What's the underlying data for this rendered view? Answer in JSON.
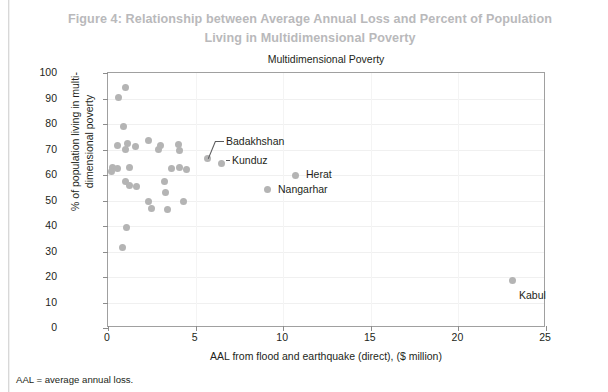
{
  "figure": {
    "title_line1": "Figure 4: Relationship between Average Annual Loss and Percent of Population",
    "title_line2": "Living in Multidimensional Poverty",
    "footnote": "AAL = average annual loss."
  },
  "chart_data": {
    "type": "scatter",
    "title": "Multidimensional Poverty",
    "xlabel": "AAL from flood and earthquake (direct), ($ million)",
    "ylabel_line1": "% of population living in multi-",
    "ylabel_line2": "dimensional poverty",
    "xlim": [
      0,
      25
    ],
    "ylim": [
      0,
      100
    ],
    "xticks": [
      0,
      5,
      10,
      15,
      20,
      25
    ],
    "yticks": [
      0,
      10,
      20,
      30,
      40,
      50,
      60,
      70,
      80,
      90,
      100
    ],
    "grid": "horizontal-and-vertical-faint",
    "legend": "none",
    "marker_color": "#b4b4b4",
    "series": [
      {
        "name": "Provinces",
        "points": [
          {
            "x": 0.6,
            "y": 90.5,
            "label": ""
          },
          {
            "x": 1.0,
            "y": 94.5,
            "label": ""
          },
          {
            "x": 0.9,
            "y": 79.0,
            "label": ""
          },
          {
            "x": 0.55,
            "y": 71.5,
            "label": ""
          },
          {
            "x": 1.1,
            "y": 72.5,
            "label": ""
          },
          {
            "x": 1.0,
            "y": 70.0,
            "label": ""
          },
          {
            "x": 1.55,
            "y": 71.0,
            "label": ""
          },
          {
            "x": 2.3,
            "y": 73.5,
            "label": ""
          },
          {
            "x": 2.9,
            "y": 70.0,
            "label": ""
          },
          {
            "x": 3.0,
            "y": 71.5,
            "label": ""
          },
          {
            "x": 4.0,
            "y": 72.0,
            "label": ""
          },
          {
            "x": 4.1,
            "y": 69.5,
            "label": ""
          },
          {
            "x": 0.25,
            "y": 63.0,
            "label": ""
          },
          {
            "x": 0.55,
            "y": 62.5,
            "label": ""
          },
          {
            "x": 0.2,
            "y": 61.5,
            "label": ""
          },
          {
            "x": 1.2,
            "y": 63.0,
            "label": ""
          },
          {
            "x": 3.6,
            "y": 62.5,
            "label": ""
          },
          {
            "x": 4.1,
            "y": 63.0,
            "label": ""
          },
          {
            "x": 4.5,
            "y": 62.0,
            "label": ""
          },
          {
            "x": 1.0,
            "y": 57.5,
            "label": ""
          },
          {
            "x": 1.25,
            "y": 56.0,
            "label": ""
          },
          {
            "x": 1.6,
            "y": 55.5,
            "label": ""
          },
          {
            "x": 3.2,
            "y": 57.5,
            "label": ""
          },
          {
            "x": 3.3,
            "y": 53.0,
            "label": ""
          },
          {
            "x": 2.3,
            "y": 49.5,
            "label": ""
          },
          {
            "x": 2.5,
            "y": 47.0,
            "label": ""
          },
          {
            "x": 3.4,
            "y": 46.5,
            "label": ""
          },
          {
            "x": 4.3,
            "y": 49.5,
            "label": ""
          },
          {
            "x": 1.05,
            "y": 39.5,
            "label": ""
          },
          {
            "x": 0.85,
            "y": 31.5,
            "label": ""
          },
          {
            "x": 5.7,
            "y": 66.5,
            "label": "Badakhshan"
          },
          {
            "x": 6.5,
            "y": 64.5,
            "label": "Kunduz"
          },
          {
            "x": 10.7,
            "y": 60.0,
            "label": "Herat"
          },
          {
            "x": 9.1,
            "y": 54.5,
            "label": "Nangarhar"
          },
          {
            "x": 23.1,
            "y": 18.5,
            "label": "Kabul"
          }
        ]
      }
    ],
    "annotations": [
      {
        "name": "Badakhshan",
        "text": "Badakhshan",
        "x": 5.7,
        "y": 66.5
      },
      {
        "name": "Kunduz",
        "text": "Kunduz",
        "x": 6.5,
        "y": 64.5
      },
      {
        "name": "Herat",
        "text": "Herat",
        "x": 10.7,
        "y": 60.0
      },
      {
        "name": "Nangarhar",
        "text": "Nangarhar",
        "x": 9.1,
        "y": 54.5
      },
      {
        "name": "Kabul",
        "text": "Kabul",
        "x": 23.1,
        "y": 18.5
      }
    ]
  }
}
